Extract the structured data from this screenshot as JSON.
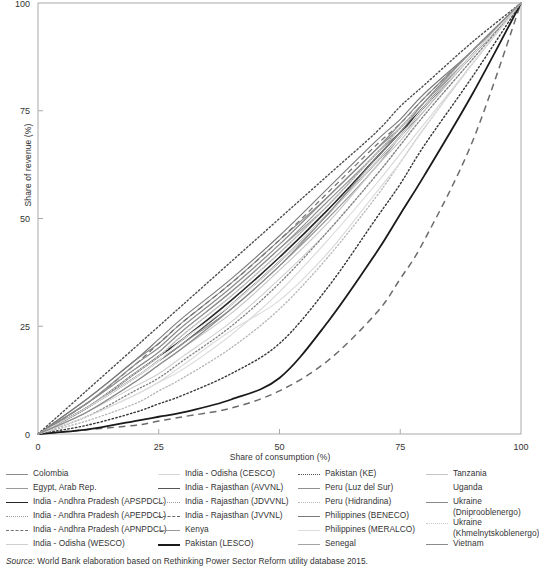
{
  "chart_data": {
    "type": "line",
    "title": "",
    "xlabel": "Share of consumption (%)",
    "ylabel": "Share of revenue (%)",
    "xlim": [
      0,
      100
    ],
    "ylim": [
      0,
      100
    ],
    "xticks": [
      "0",
      "25",
      "50",
      "75",
      "100"
    ],
    "yticks": [
      "0",
      "25",
      "50",
      "75",
      "100"
    ],
    "grid": false,
    "legend_position": "below",
    "x": [
      0,
      10,
      20,
      25,
      30,
      40,
      50,
      60,
      70,
      75,
      80,
      90,
      100
    ],
    "series": [
      {
        "name": "Colombia",
        "style": "solid",
        "color": "#8c8c8c",
        "width": 1.1,
        "values": [
          0,
          8,
          17,
          21,
          26,
          35,
          45,
          55,
          66,
          71,
          77,
          88,
          100
        ]
      },
      {
        "name": "Egypt, Arab Rep.",
        "style": "solid",
        "color": "#9a9a9a",
        "width": 1.1,
        "values": [
          0,
          7,
          15,
          19,
          24,
          33,
          43,
          53,
          65,
          70,
          76,
          88,
          100
        ]
      },
      {
        "name": "India - Andhra Pradesh (APSPDCL)",
        "style": "solid",
        "color": "#262626",
        "width": 1.6,
        "values": [
          0,
          6,
          14,
          18,
          22,
          31,
          41,
          52,
          64,
          70,
          76,
          88,
          100
        ]
      },
      {
        "name": "India - Andhra Pradesh (APEPDCL)",
        "style": "dotted",
        "color": "#4d4d4d",
        "width": 1.4,
        "values": [
          0,
          10,
          20,
          25,
          30,
          40,
          50,
          60,
          70,
          76,
          81,
          91,
          100
        ]
      },
      {
        "name": "India - Andhra Pradesh (APNPDCL)",
        "style": "dashed",
        "color": "#707070",
        "width": 1.2,
        "values": [
          0,
          7,
          16,
          21,
          26,
          35,
          45,
          56,
          67,
          72,
          78,
          89,
          100
        ]
      },
      {
        "name": "India - Odisha (WESCO)",
        "style": "solid",
        "color": "#cfcfcf",
        "width": 1.1,
        "values": [
          0,
          5,
          11,
          14,
          18,
          26,
          36,
          47,
          60,
          67,
          74,
          87,
          100
        ]
      },
      {
        "name": "India - Odisha (CESCO)",
        "style": "solid",
        "color": "#d8d8d8",
        "width": 1.1,
        "values": [
          0,
          4,
          9,
          12,
          15,
          23,
          33,
          45,
          58,
          65,
          72,
          86,
          100
        ]
      },
      {
        "name": "India - Rajasthan (AVVNL)",
        "style": "solid",
        "color": "#555555",
        "width": 1.5,
        "values": [
          0,
          6,
          13,
          17,
          21,
          30,
          40,
          51,
          63,
          69,
          76,
          88,
          100
        ]
      },
      {
        "name": "India - Rajasthan (JDVVNL)",
        "style": "dotted",
        "color": "#808080",
        "width": 1.3,
        "values": [
          0,
          4,
          10,
          13,
          17,
          25,
          35,
          47,
          60,
          67,
          74,
          87,
          100
        ]
      },
      {
        "name": "India - Rajasthan (JVVNL)",
        "style": "dashed",
        "color": "#6b6b6b",
        "width": 1.5,
        "values": [
          0,
          1,
          2,
          3,
          4,
          6,
          10,
          17,
          28,
          36,
          45,
          68,
          100
        ]
      },
      {
        "name": "Kenya",
        "style": "solid",
        "color": "#999999",
        "width": 1.1,
        "values": [
          0,
          6,
          13,
          17,
          21,
          29,
          39,
          50,
          62,
          69,
          75,
          88,
          100
        ]
      },
      {
        "name": "Pakistan (LESCO)",
        "style": "solid",
        "color": "#1a1a1a",
        "width": 1.8,
        "values": [
          0,
          1,
          3,
          4,
          5,
          8,
          13,
          26,
          42,
          51,
          60,
          79,
          100
        ]
      },
      {
        "name": "Pakistan (KE)",
        "style": "dotted",
        "color": "#333333",
        "width": 1.4,
        "values": [
          0,
          2,
          5,
          7,
          9,
          14,
          21,
          34,
          50,
          58,
          67,
          83,
          100
        ]
      },
      {
        "name": "Peru (Luz del Sur)",
        "style": "solid",
        "color": "#8f8f8f",
        "width": 1.1,
        "values": [
          0,
          7,
          15,
          19,
          24,
          33,
          43,
          54,
          65,
          71,
          77,
          88,
          100
        ]
      },
      {
        "name": "Peru (Hidrandina)",
        "style": "dotted",
        "color": "#b5b5b5",
        "width": 1.3,
        "values": [
          0,
          3,
          7,
          10,
          13,
          20,
          29,
          41,
          55,
          63,
          71,
          86,
          100
        ]
      },
      {
        "name": "Philippines (BENECO)",
        "style": "solid",
        "color": "#7a7a7a",
        "width": 1.1,
        "values": [
          0,
          8,
          17,
          22,
          27,
          36,
          46,
          57,
          68,
          73,
          79,
          89,
          100
        ]
      },
      {
        "name": "Philippines (MERALCO)",
        "style": "solid",
        "color": "#dcdcdc",
        "width": 1.2,
        "values": [
          0,
          4,
          9,
          12,
          16,
          24,
          31,
          42,
          56,
          63,
          71,
          86,
          100
        ]
      },
      {
        "name": "Senegal",
        "style": "solid",
        "color": "#a5a5a5",
        "width": 1.1,
        "values": [
          0,
          6,
          14,
          18,
          23,
          32,
          42,
          53,
          65,
          71,
          77,
          88,
          100
        ]
      },
      {
        "name": "Tanzania",
        "style": "solid",
        "color": "#c4c4c4",
        "width": 1.1,
        "values": [
          0,
          5,
          12,
          16,
          20,
          28,
          38,
          49,
          62,
          68,
          75,
          88,
          100
        ]
      },
      {
        "name": "Uganda",
        "style": "solid",
        "color": "#e8e8e8",
        "width": 1.1,
        "values": [
          0,
          6,
          13,
          17,
          22,
          30,
          40,
          51,
          63,
          69,
          76,
          88,
          100
        ]
      },
      {
        "name": "Ukraine (Dniprooblenergo)",
        "style": "solid",
        "color": "#8a8a8a",
        "width": 1.2,
        "values": [
          0,
          7,
          16,
          20,
          25,
          34,
          44,
          55,
          66,
          72,
          78,
          89,
          100
        ]
      },
      {
        "name": "Ukraine (Khmelnytskoblenergo)",
        "style": "dotted",
        "color": "#c8c8c8",
        "width": 1.3,
        "values": [
          0,
          6,
          14,
          18,
          23,
          32,
          42,
          53,
          65,
          71,
          77,
          89,
          100
        ]
      },
      {
        "name": "Vietnam",
        "style": "solid",
        "color": "#8a8a8a",
        "width": 1.2,
        "values": [
          0,
          5,
          12,
          16,
          20,
          29,
          39,
          51,
          64,
          70,
          77,
          89,
          100
        ]
      }
    ]
  },
  "axes": {
    "x_title": "Share of consumption (%)",
    "y_title": "Share of revenue (%)",
    "x_ticks": [
      "0",
      "25",
      "50",
      "75",
      "100"
    ],
    "y_ticks": [
      "0",
      "25",
      "50",
      "75",
      "100"
    ]
  },
  "legend": {
    "columns": [
      {
        "items": [
          {
            "label": "Colombia",
            "style": "solid",
            "color": "#8c8c8c",
            "width": 1.1
          },
          {
            "label": "Egypt, Arab Rep.",
            "style": "solid",
            "color": "#9a9a9a",
            "width": 1.1
          },
          {
            "label": "India - Andhra Pradesh (APSPDCL)",
            "style": "solid",
            "color": "#262626",
            "width": 1.8
          },
          {
            "label": "India - Andhra Pradesh (APEPDCL)",
            "style": "dotted",
            "color": "#9a9a9a",
            "width": 1.4
          },
          {
            "label": "India - Andhra Pradesh (APNPDCL)",
            "style": "dashed",
            "color": "#707070",
            "width": 1.3
          },
          {
            "label": "India - Odisha (WESCO)",
            "style": "solid",
            "color": "#cfcfcf",
            "width": 1.2
          }
        ]
      },
      {
        "items": [
          {
            "label": "India - Odisha (CESCO)",
            "style": "solid",
            "color": "#d8d8d8",
            "width": 1.2
          },
          {
            "label": "India - Rajasthan (AVVNL)",
            "style": "solid",
            "color": "#555555",
            "width": 1.6
          },
          {
            "label": "India - Rajasthan (JDVVNL)",
            "style": "dotted",
            "color": "#9a9a9a",
            "width": 1.4
          },
          {
            "label": "India - Rajasthan (JVVNL)",
            "style": "dashed",
            "color": "#6b6b6b",
            "width": 1.5
          },
          {
            "label": "Kenya",
            "style": "solid",
            "color": "#999999",
            "width": 1.2
          },
          {
            "label": "Pakistan (LESCO)",
            "style": "solid",
            "color": "#1a1a1a",
            "width": 2.0
          }
        ]
      },
      {
        "items": [
          {
            "label": "Pakistan (KE)",
            "style": "dotted",
            "color": "#555555",
            "width": 1.5
          },
          {
            "label": "Peru (Luz del Sur)",
            "style": "solid",
            "color": "#8f8f8f",
            "width": 1.2
          },
          {
            "label": "Peru (Hidrandina)",
            "style": "dotted",
            "color": "#bcbcbc",
            "width": 1.4
          },
          {
            "label": "Philippines (BENECO)",
            "style": "solid",
            "color": "#7a7a7a",
            "width": 1.2
          },
          {
            "label": "Philippines (MERALCO)",
            "style": "solid",
            "color": "#dcdcdc",
            "width": 1.2
          },
          {
            "label": "Senegal",
            "style": "solid",
            "color": "#a5a5a5",
            "width": 1.2
          }
        ]
      },
      {
        "items": [
          {
            "label": "Tanzania",
            "style": "solid",
            "color": "#c4c4c4",
            "width": 1.2
          },
          {
            "label": "Uganda",
            "style": "none",
            "color": "#ffffff",
            "width": 0
          },
          {
            "label": "Ukraine\n(Dniprooblenergo)",
            "style": "solid",
            "color": "#8a8a8a",
            "width": 1.3
          },
          {
            "label": "Ukraine\n(Khmelnytskoblenergo)",
            "style": "dotted",
            "color": "#c8c8c8",
            "width": 1.4
          },
          {
            "label": "Vietnam",
            "style": "solid",
            "color": "#8a8a8a",
            "width": 1.3
          }
        ]
      }
    ]
  },
  "source": {
    "lead": "Source:",
    "text": " World Bank elaboration based on Rethinking Power Sector Reform utility database 2015."
  }
}
